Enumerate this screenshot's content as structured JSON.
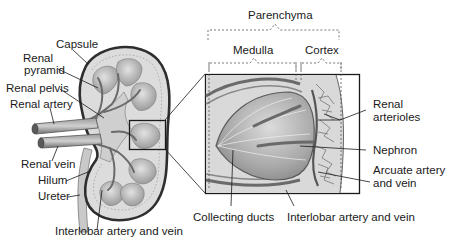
{
  "diagram": {
    "colors": {
      "background": "#ffffff",
      "line": "#1a1a1a",
      "tissue_light": "#d6d6d6",
      "tissue_mid": "#b8b8b8",
      "tissue_dark": "#8a8a8a",
      "capsule": "#3a3a3a",
      "vessel": "#7a7a7a"
    },
    "left_labels": {
      "capsule": "Capsule",
      "renal_pyramid_line1": "Renal",
      "renal_pyramid_line2": "pyramid",
      "renal_pelvis": "Renal pelvis",
      "renal_artery": "Renal artery",
      "renal_vein": "Renal vein",
      "hilum": "Hilum",
      "ureter": "Ureter",
      "interlobar_bottom": "Interlobar artery and vein"
    },
    "top_labels": {
      "parenchyma": "Parenchyma",
      "medulla": "Medulla",
      "cortex": "Cortex"
    },
    "right_labels": {
      "renal_arterioles_line1": "Renal",
      "renal_arterioles_line2": "arterioles",
      "nephron": "Nephron",
      "arcuate_line1": "Arcuate artery",
      "arcuate_line2": "and vein"
    },
    "bottom_labels": {
      "collecting_ducts": "Collecting ducts",
      "interlobar_detail": "Interlobar artery and vein"
    }
  }
}
